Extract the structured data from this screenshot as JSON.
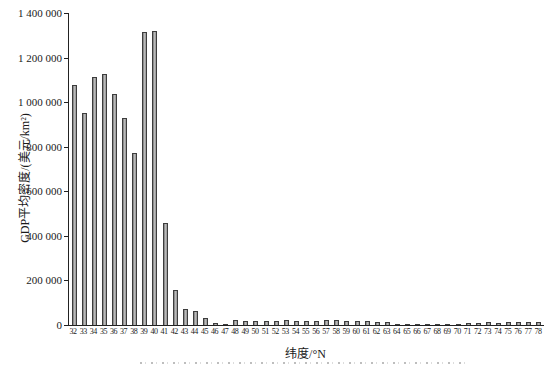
{
  "chart_data": {
    "type": "bar",
    "title": "",
    "xlabel": "纬度/°N",
    "ylabel": "GDP平均密度/(美元/km²)",
    "ylim": [
      0,
      1400000
    ],
    "ytick_interval": 200000,
    "ytick_labels": [
      "0",
      "200 000",
      "400 000",
      "600 000",
      "800 000",
      "1 000 000",
      "1 200 000",
      "1 400 000"
    ],
    "grid": false,
    "legend": "none",
    "bar_fill_color": "#a6a6a6",
    "bar_border_color": "#3d3d3d",
    "categories": [
      32,
      33,
      34,
      35,
      36,
      37,
      38,
      39,
      40,
      41,
      42,
      43,
      44,
      45,
      46,
      47,
      48,
      49,
      50,
      51,
      52,
      53,
      54,
      55,
      56,
      57,
      58,
      59,
      60,
      61,
      62,
      63,
      64,
      65,
      66,
      67,
      68,
      69,
      70,
      71,
      72,
      73,
      74,
      75,
      76,
      77,
      78
    ],
    "values": [
      1075000,
      950000,
      1115000,
      1125000,
      1035000,
      930000,
      770000,
      1315000,
      1320000,
      460000,
      155000,
      70000,
      65000,
      30000,
      10000,
      5000,
      22000,
      20000,
      20000,
      18000,
      20000,
      22000,
      20000,
      20000,
      20000,
      22000,
      22000,
      20000,
      18000,
      16000,
      15000,
      14000,
      6000,
      5000,
      6000,
      5000,
      6000,
      5000,
      6000,
      11000,
      11000,
      12000,
      11000,
      12000,
      12000,
      15000,
      15000
    ]
  }
}
